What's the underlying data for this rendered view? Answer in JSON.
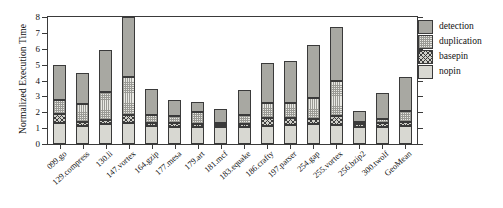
{
  "chart_data": {
    "type": "bar",
    "subtype": "stacked-bar",
    "title": "",
    "xlabel": "",
    "ylabel": "Normalized Execution Time",
    "ylim": [
      0,
      8
    ],
    "yticks": [
      0,
      1,
      2,
      3,
      4,
      5,
      6,
      7,
      8
    ],
    "ytick_labels": [
      "0",
      "1",
      "2",
      "3",
      "4",
      "5",
      "6",
      "7",
      "8"
    ],
    "grid": false,
    "legend_position": "right",
    "legend_order": [
      "detection",
      "duplication",
      "basepin",
      "nopin"
    ],
    "stack_order_bottom_to_top": [
      "nopin",
      "basepin",
      "duplication",
      "detection"
    ],
    "categories": [
      "099.go",
      "129.compress",
      "130.li",
      "147.vortex",
      "164.gzip",
      "177.mesa",
      "179.art",
      "181.mcf",
      "183.equake",
      "186.crafty",
      "197.parser",
      "254.gap",
      "255.vortex",
      "256.bzip2",
      "300.twolf",
      "GeoMean"
    ],
    "series": [
      {
        "name": "nopin",
        "color": "#d8d8d2",
        "values": [
          1.3,
          1.15,
          1.25,
          1.3,
          1.15,
          1.1,
          1.1,
          1.05,
          1.1,
          1.15,
          1.2,
          1.25,
          1.2,
          1.1,
          1.1,
          1.15
        ]
      },
      {
        "name": "basepin",
        "color": "#cfcfc9",
        "values": [
          0.6,
          0.25,
          0.25,
          0.55,
          0.15,
          0.25,
          0.15,
          0.15,
          0.15,
          0.5,
          0.45,
          0.3,
          0.55,
          0.15,
          0.2,
          0.25
        ]
      },
      {
        "name": "duplication",
        "color": "#e9e9e4",
        "values": [
          0.85,
          1.1,
          1.8,
          2.35,
          0.55,
          0.4,
          0.75,
          0.15,
          0.55,
          0.95,
          0.95,
          1.35,
          2.25,
          0.15,
          0.3,
          0.7
        ]
      },
      {
        "name": "detection",
        "color": "#a8a8a2",
        "values": [
          2.25,
          1.95,
          2.65,
          3.8,
          1.6,
          1.0,
          0.65,
          0.85,
          1.6,
          2.5,
          2.6,
          3.35,
          3.35,
          0.7,
          1.6,
          2.1
        ]
      }
    ],
    "cumulative_tops": [
      [
        1.3,
        1.9,
        2.75,
        5.0
      ],
      [
        1.15,
        1.4,
        2.5,
        4.45
      ],
      [
        1.25,
        1.5,
        3.3,
        5.95
      ],
      [
        1.3,
        1.85,
        4.2,
        8.0
      ],
      [
        1.15,
        1.3,
        1.85,
        3.45
      ],
      [
        1.1,
        1.35,
        1.75,
        2.75
      ],
      [
        1.1,
        1.25,
        2.0,
        2.65
      ],
      [
        1.05,
        1.2,
        1.35,
        2.2
      ],
      [
        1.1,
        1.25,
        1.8,
        3.4
      ],
      [
        1.15,
        1.65,
        2.6,
        5.1
      ],
      [
        1.2,
        1.65,
        2.6,
        5.2
      ],
      [
        1.25,
        1.55,
        2.9,
        6.25
      ],
      [
        1.2,
        1.75,
        4.0,
        7.35
      ],
      [
        1.1,
        1.25,
        1.4,
        2.1
      ],
      [
        1.1,
        1.3,
        1.6,
        3.2
      ],
      [
        1.15,
        1.4,
        2.1,
        4.2
      ]
    ],
    "totals": [
      5.0,
      4.45,
      5.95,
      8.0,
      3.45,
      2.75,
      2.65,
      2.2,
      3.4,
      5.1,
      5.2,
      6.25,
      7.35,
      2.1,
      3.2,
      4.2
    ]
  },
  "legend": {
    "items": [
      {
        "label": "detection",
        "key": "detection"
      },
      {
        "label": "duplication",
        "key": "duplication"
      },
      {
        "label": "basepin",
        "key": "basepin"
      },
      {
        "label": "nopin",
        "key": "nopin"
      }
    ]
  },
  "axis": {
    "y_title": "Normalized Execution Time"
  }
}
